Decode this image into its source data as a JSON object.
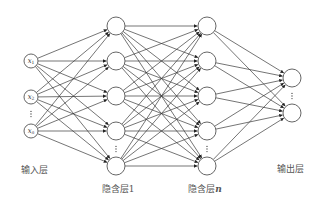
{
  "diagram": {
    "type": "feedforward-neural-network",
    "colors": {
      "edge": "#3a3a3a",
      "node_stroke": "#555555",
      "node_fill": "#ffffff",
      "label_text": "#555555"
    },
    "layers": [
      {
        "id": "input",
        "label": "输入层",
        "x": 31,
        "node_radius": 7,
        "nodes": [
          {
            "y": 61,
            "symbol": "x",
            "subscript": "1"
          },
          {
            "y": 97,
            "symbol": "x",
            "subscript": "2"
          },
          {
            "y": 131,
            "symbol": "x",
            "subscript": "n"
          }
        ],
        "ellipsis_y": 114,
        "label_pos": {
          "x": 34,
          "y": 169
        }
      },
      {
        "id": "hidden1",
        "label": "隐含层1",
        "x": 116,
        "node_radius": 9,
        "nodes": [
          {
            "y": 26
          },
          {
            "y": 61
          },
          {
            "y": 96
          },
          {
            "y": 131
          },
          {
            "y": 166
          }
        ],
        "ellipsis_y": 149,
        "label_pos": {
          "x": 118,
          "y": 188
        }
      },
      {
        "id": "hiddenN",
        "label_prefix": "隐含层",
        "label_suffix": "n",
        "x": 207,
        "node_radius": 9,
        "nodes": [
          {
            "y": 26
          },
          {
            "y": 61
          },
          {
            "y": 96
          },
          {
            "y": 131
          },
          {
            "y": 166
          }
        ],
        "ellipsis_y": 149,
        "label_pos": {
          "x": 205,
          "y": 188
        }
      },
      {
        "id": "output",
        "label": "输出层",
        "x": 292,
        "node_radius": 9,
        "nodes": [
          {
            "y": 78
          },
          {
            "y": 113
          }
        ],
        "ellipsis_y": 96,
        "label_pos": {
          "x": 290,
          "y": 168
        }
      }
    ],
    "connections": "fully-connected between consecutive layers, arrows pointing right"
  }
}
